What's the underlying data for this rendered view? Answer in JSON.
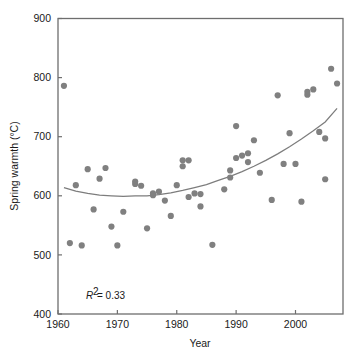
{
  "chart_data": {
    "type": "scatter",
    "title": "",
    "xlabel": "Year",
    "ylabel": "Spring warmth (°C)",
    "xlim": [
      1960,
      2008
    ],
    "ylim": [
      400,
      900
    ],
    "xticks": [
      1960,
      1970,
      1980,
      1990,
      2000
    ],
    "yticks": [
      400,
      500,
      600,
      700,
      800,
      900
    ],
    "xtick_labels": [
      "1960",
      "1970",
      "1980",
      "1990",
      "2000"
    ],
    "ytick_labels": [
      "400",
      "500",
      "600",
      "700",
      "800",
      "900"
    ],
    "grid": false,
    "legend": false,
    "point_color": "#808080",
    "line_color": "#7d7d7d",
    "x": [
      1961,
      1962,
      1963,
      1964,
      1965,
      1966,
      1967,
      1968,
      1969,
      1970,
      1971,
      1973,
      1973,
      1974,
      1975,
      1976,
      1976,
      1977,
      1978,
      1979,
      1980,
      1981,
      1981,
      1982,
      1982,
      1983,
      1984,
      1984,
      1986,
      1988,
      1989,
      1989,
      1990,
      1990,
      1991,
      1992,
      1992,
      1993,
      1994,
      1996,
      1997,
      1998,
      1999,
      2000,
      2001,
      2002,
      2002,
      2003,
      2004,
      2005,
      2005,
      2006,
      2007
    ],
    "y": [
      786,
      520,
      618,
      516,
      645,
      577,
      629,
      647,
      548,
      516,
      573,
      624,
      620,
      617,
      545,
      604,
      601,
      607,
      592,
      566,
      618,
      650,
      660,
      660,
      598,
      604,
      582,
      603,
      517,
      611,
      631,
      643,
      718,
      664,
      668,
      672,
      657,
      694,
      639,
      593,
      770,
      654,
      706,
      654,
      590,
      771,
      776,
      780,
      708,
      697,
      628,
      815,
      790
    ],
    "annotations": [
      {
        "text": "R² = 0.33",
        "x": 1966.5,
        "y": 432
      }
    ],
    "trend": {
      "type": "quadratic-fit",
      "description": "fitted curve, minimum near 1975 at about 600",
      "points": [
        [
          1961,
          614
        ],
        [
          1963,
          608
        ],
        [
          1965,
          604
        ],
        [
          1967,
          601
        ],
        [
          1969,
          600
        ],
        [
          1971,
          599
        ],
        [
          1973,
          600
        ],
        [
          1975,
          600
        ],
        [
          1977,
          602
        ],
        [
          1979,
          605
        ],
        [
          1981,
          609
        ],
        [
          1983,
          614
        ],
        [
          1985,
          619
        ],
        [
          1987,
          626
        ],
        [
          1989,
          633
        ],
        [
          1991,
          641
        ],
        [
          1993,
          650
        ],
        [
          1995,
          660
        ],
        [
          1997,
          671
        ],
        [
          1999,
          683
        ],
        [
          2001,
          696
        ],
        [
          2003,
          710
        ],
        [
          2005,
          725
        ],
        [
          2007,
          748
        ]
      ]
    }
  },
  "axes": {
    "x_title": "Year",
    "y_title": "Spring warmth (°C)"
  },
  "annotation": {
    "r_symbol": "R",
    "superscript": "2",
    "equals_value": " = 0.33"
  }
}
